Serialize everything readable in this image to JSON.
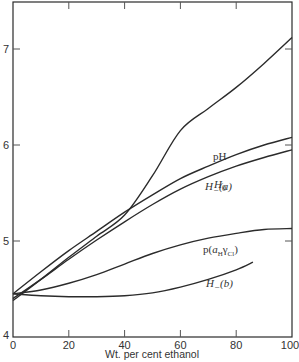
{
  "chart_data": {
    "type": "line",
    "title": "",
    "xlabel": "Wt. per cent ethanol",
    "ylabel": "",
    "xlim": [
      0,
      100
    ],
    "ylim": [
      4,
      7.4
    ],
    "x_ticks": [
      0,
      20,
      40,
      60,
      80,
      100
    ],
    "y_ticks": [
      4,
      5,
      6,
      7
    ],
    "grid": false,
    "legend": "inline labels",
    "series": [
      {
        "name": "pH",
        "label_display": "pH",
        "x": [
          0,
          10,
          20,
          30,
          40,
          50,
          60,
          70,
          80,
          90,
          100
        ],
        "values": [
          4.38,
          4.6,
          4.83,
          5.05,
          5.27,
          5.68,
          6.15,
          6.38,
          6.6,
          6.85,
          7.12
        ]
      },
      {
        "name": "H_-(a)",
        "label_display": "H₋(a)",
        "x": [
          0,
          10,
          20,
          30,
          40,
          50,
          60,
          70,
          80,
          90,
          100
        ],
        "values": [
          4.45,
          4.68,
          4.9,
          5.1,
          5.3,
          5.48,
          5.65,
          5.78,
          5.9,
          6.0,
          6.08
        ]
      },
      {
        "name": "H_0",
        "label_display": "H₀",
        "x": [
          0,
          10,
          20,
          30,
          40,
          50,
          60,
          70,
          80,
          90,
          100
        ],
        "values": [
          4.4,
          4.6,
          4.81,
          5.01,
          5.2,
          5.38,
          5.54,
          5.67,
          5.78,
          5.87,
          5.95
        ]
      },
      {
        "name": "p(a_H gamma_Cl)",
        "label_display": "p(aₕγCl)",
        "x": [
          0,
          10,
          20,
          30,
          40,
          50,
          60,
          70,
          80,
          90,
          100
        ],
        "values": [
          4.45,
          4.49,
          4.56,
          4.65,
          4.76,
          4.87,
          4.96,
          5.03,
          5.08,
          5.12,
          5.13
        ]
      },
      {
        "name": "H_-(b)",
        "label_display": "H₋(b)",
        "x": [
          0,
          10,
          20,
          30,
          40,
          50,
          60,
          70,
          80,
          86
        ],
        "values": [
          4.45,
          4.43,
          4.42,
          4.42,
          4.43,
          4.46,
          4.52,
          4.6,
          4.7,
          4.78
        ]
      }
    ]
  },
  "labels": {
    "x_ticks": [
      "0",
      "20",
      "40",
      "60",
      "80",
      "100"
    ],
    "y_ticks": [
      "4",
      "5",
      "6",
      "7"
    ],
    "xlabel": "Wt. per cent ethanol",
    "pH": "pH",
    "Ha_main": "H",
    "Ha_sub": "−",
    "Ha_suffix": "(a)",
    "H0_main": "H",
    "H0_sub": "0",
    "pa_prefix": "p(",
    "pa_a": "a",
    "pa_sub_H": "H",
    "pa_gamma": "γ",
    "pa_sub_Cl": "Cl",
    "pa_suffix": ")",
    "Hb_main": "H",
    "Hb_sub": "−",
    "Hb_suffix": "(b)"
  }
}
